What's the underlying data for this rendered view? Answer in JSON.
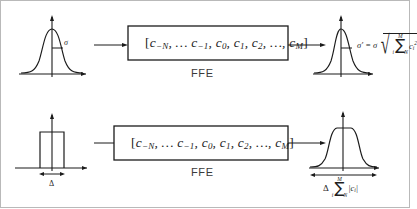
{
  "figure": {
    "name": "ffe-noise-and-pulse-propagation-diagram",
    "background": "#ffffff",
    "border_color": "#b9b9b9",
    "ink_color": "#1b1b1b"
  },
  "rows": [
    {
      "id": "top",
      "description": "Gaussian noise distribution through FFE produces widened Gaussian",
      "input": {
        "waveform": "gaussian-curve",
        "marker_label": "σ"
      },
      "block": {
        "label": "FFE",
        "coefficients": {
          "open_bracket": "[",
          "close_bracket": "]",
          "terms": [
            {
              "base": "c",
              "sub": "−N"
            },
            {
              "base": "…",
              "sub": ""
            },
            {
              "base": "c",
              "sub": "−1"
            },
            {
              "base": "c",
              "sub": "0"
            },
            {
              "base": "c",
              "sub": "1"
            },
            {
              "base": "c",
              "sub": "2"
            },
            {
              "base": "…",
              "sub": ""
            },
            {
              "base": "c",
              "sub": "M"
            }
          ]
        }
      },
      "output": {
        "waveform": "gaussian-curve",
        "formula": {
          "lead": "σ′ = σ",
          "radical": "√",
          "sum_upper": "M",
          "sum_glyph": "∑",
          "sum_lower": "i = −N",
          "term_base": "c",
          "term_sub": "i",
          "term_sup": "2"
        }
      }
    },
    {
      "id": "bottom",
      "description": "Rectangular pulse of width delta through FFE produces broadened flat-topped pulse",
      "input": {
        "waveform": "rectangular-pulse",
        "marker_label": "Δ"
      },
      "block": {
        "label": "FFE",
        "coefficients": {
          "open_bracket": "[",
          "close_bracket": "]",
          "terms": [
            {
              "base": "c",
              "sub": "−N"
            },
            {
              "base": "…",
              "sub": ""
            },
            {
              "base": "c",
              "sub": "−1"
            },
            {
              "base": "c",
              "sub": "0"
            },
            {
              "base": "c",
              "sub": "1"
            },
            {
              "base": "c",
              "sub": "2"
            },
            {
              "base": "…",
              "sub": ""
            },
            {
              "base": "c",
              "sub": "M"
            }
          ]
        }
      },
      "output": {
        "waveform": "flat-top-pulse",
        "formula": {
          "lead": "Δ",
          "sum_upper": "M",
          "sum_glyph": "∑",
          "sum_lower": "i = −N",
          "term": "|c",
          "term_sub": "i",
          "term_close": "|"
        }
      }
    }
  ]
}
